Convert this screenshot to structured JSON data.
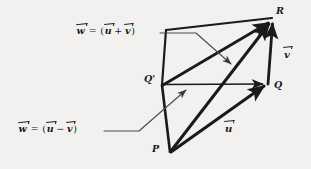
{
  "figure": {
    "background_color": "#f2f1ef",
    "ink_color": "#1a1a1a"
  },
  "equations": {
    "sum": {
      "lhs": "w",
      "equals": "=",
      "open": "(",
      "term1": "u",
      "operator": "+",
      "term2": "v",
      "close": ")",
      "plain_text": "w = (u + v)"
    },
    "difference": {
      "lhs": "w",
      "equals": "=",
      "open": "(",
      "term1": "u",
      "operator": "−",
      "term2": "v",
      "close": ")",
      "plain_text": "w = (u − v)"
    }
  },
  "vector_labels": {
    "u": "u",
    "v": "v"
  },
  "points": {
    "P": "P",
    "Q": "Q",
    "Q_prime": "Q'",
    "R": "R"
  },
  "geometry": {
    "vertices": {
      "P": [
        170,
        152
      ],
      "Q": [
        268,
        84
      ],
      "Q_prime": [
        162,
        85
      ],
      "R": [
        272,
        18
      ],
      "S_top_left": [
        166,
        30
      ]
    },
    "edges": [
      {
        "name": "u-vector",
        "from": "P",
        "to": "Q",
        "style": "thick-arrow"
      },
      {
        "name": "v-vector",
        "from": "Q",
        "to": "R",
        "style": "thick-arrow"
      },
      {
        "name": "sum-vector",
        "from": "P",
        "to": "R",
        "style": "thick-arrow"
      },
      {
        "name": "difference-vector",
        "from": "Q_prime",
        "to": "Q",
        "style": "thin-arrow"
      },
      {
        "name": "translated-u",
        "from": "Q_prime",
        "to": "R",
        "style": "thick-arrow"
      },
      {
        "name": "left-edge",
        "from": "P",
        "to": "Q_prime",
        "style": "thick-plain"
      },
      {
        "name": "top-edge",
        "from": "S_top_left",
        "to": "R",
        "style": "thick-plain"
      },
      {
        "name": "upper-left-edge",
        "from": "Q_prime",
        "to": "S_top_left",
        "style": "thick-plain"
      }
    ],
    "leaders": [
      {
        "name": "sum-leader",
        "path": "horizontal then diagonal to arrow at (236,67)"
      },
      {
        "name": "difference-leader",
        "path": "horizontal then diagonal to arrow at (191,88)"
      }
    ]
  }
}
